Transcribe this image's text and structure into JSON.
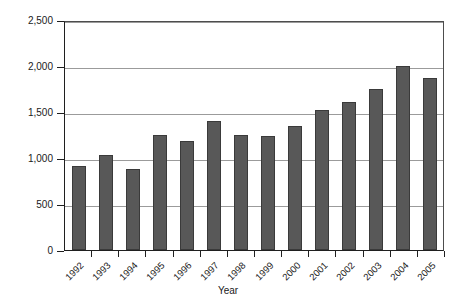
{
  "chart_data": {
    "type": "bar",
    "title": "",
    "xlabel": "Year",
    "ylabel": "Number of Phase II Awards",
    "categories": [
      "1992",
      "1993",
      "1994",
      "1995",
      "1996",
      "1997",
      "1998",
      "1999",
      "2000",
      "2001",
      "2002",
      "2003",
      "2004",
      "2005"
    ],
    "values": [
      910,
      1030,
      880,
      1245,
      1190,
      1400,
      1245,
      1235,
      1345,
      1520,
      1605,
      1750,
      2000,
      1870
    ],
    "ylim": [
      0,
      2500
    ],
    "yticks": [
      0,
      500,
      1000,
      1500,
      2000,
      2500
    ],
    "ytick_labels": [
      "0",
      "500",
      "1,000",
      "1,500",
      "2,000",
      "2,500"
    ],
    "grid": true,
    "legend": "none",
    "bar_color": "#585858",
    "bar_edge_color": "#3a3a3a",
    "gridline_color": "#9b9b9b",
    "axis_color": "#1f1f1f",
    "background": "#ffffff"
  }
}
